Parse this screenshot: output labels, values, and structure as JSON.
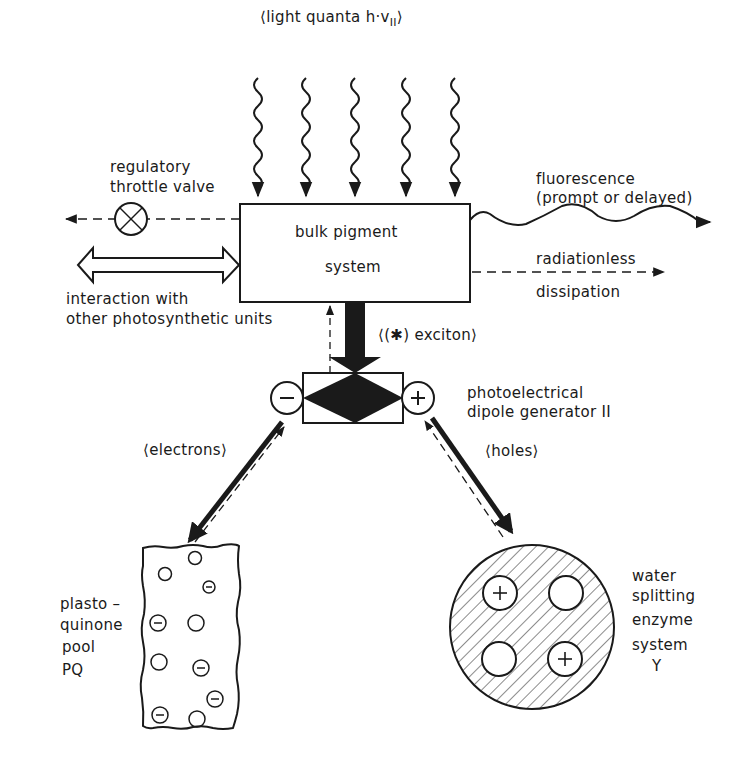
{
  "diagram": {
    "light_quanta": {
      "open": "⟨light quanta h·v",
      "sub": "II",
      "close": "⟩"
    },
    "throttle_valve": {
      "line1": "regulatory",
      "line2": "throttle valve"
    },
    "interaction": {
      "line1": "interaction with",
      "line2": "other photosynthetic units"
    },
    "bulk_pigment": {
      "line1": "bulk pigment",
      "line2": "system"
    },
    "fluorescence": {
      "line1": "fluorescence",
      "line2": "(prompt or delayed)"
    },
    "radiationless": {
      "line1": "radiationless",
      "line2": "dissipation"
    },
    "exciton": "⟨(✱) exciton⟩",
    "dipole_generator": {
      "line1": "photoelectrical",
      "line2": "dipole generator II",
      "minus": "−",
      "plus": "+"
    },
    "electrons": "⟨electrons⟩",
    "holes": "⟨holes⟩",
    "plastoquinone": {
      "line1": "plasto –",
      "line2": "quinone",
      "line3": "pool",
      "line4": "PQ"
    },
    "water_splitting": {
      "line1": "water",
      "line2": "splitting",
      "line3": "enzyme",
      "line4": "system",
      "line5": "Y"
    },
    "colors": {
      "ink": "#1a1a1a",
      "paper": "#ffffff"
    }
  }
}
